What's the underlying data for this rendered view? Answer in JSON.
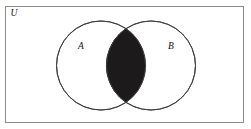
{
  "figure": {
    "type": "venn-diagram",
    "background_color": "#ffffff",
    "canvas": {
      "width": 251,
      "height": 129
    }
  },
  "universe": {
    "label": "U",
    "label_x": 14,
    "label_y": 14,
    "rect": {
      "x": 5.5,
      "y": 6.5,
      "width": 238,
      "height": 116
    },
    "border_color": "#8c8c8c",
    "border_width": 1,
    "fill_color": "#ffffff"
  },
  "sets": [
    {
      "name": "set-a",
      "label": "A",
      "label_x": 81,
      "label_y": 47,
      "cx": 101,
      "cy": 65.5,
      "r": 44.5,
      "stroke_color": "#3f3f3f",
      "stroke_width": 1,
      "fill_color": "#ffffff"
    },
    {
      "name": "set-b",
      "label": "B",
      "label_x": 171,
      "label_y": 47,
      "cx": 151,
      "cy": 65.5,
      "r": 44.5,
      "stroke_color": "#3f3f3f",
      "stroke_width": 1,
      "fill_color": "#ffffff"
    }
  ],
  "shaded_region": {
    "name": "intersection",
    "notation": "A ∩ B",
    "fill_color": "#1c1a1a",
    "top_tip_x": 126,
    "top_tip_y": 28.6,
    "bottom_tip_x": 126,
    "bottom_tip_y": 102.4,
    "path": "M 126 28.6 A 44.5 44.5 0 0 1 126 102.4 A 44.5 44.5 0 0 1 126 28.6 Z"
  }
}
